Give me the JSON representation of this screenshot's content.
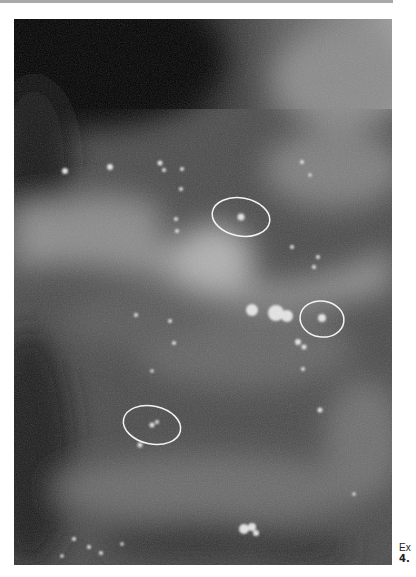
{
  "page": {
    "top_rule_color": "#a9a9a9"
  },
  "figure": {
    "type": "mammogram",
    "annotations": [
      {
        "shape": "ellipse",
        "label": "circled-calcification-upper",
        "cx": 227,
        "cy": 198,
        "rx": 29,
        "ry": 19
      },
      {
        "shape": "ellipse",
        "label": "circled-calcification-right",
        "cx": 308,
        "cy": 300,
        "rx": 22,
        "ry": 18
      },
      {
        "shape": "ellipse",
        "label": "circled-calcification-lower",
        "cx": 138,
        "cy": 406,
        "rx": 29,
        "ry": 19
      }
    ]
  },
  "caption": {
    "line1": "Ex",
    "line2": "4."
  }
}
